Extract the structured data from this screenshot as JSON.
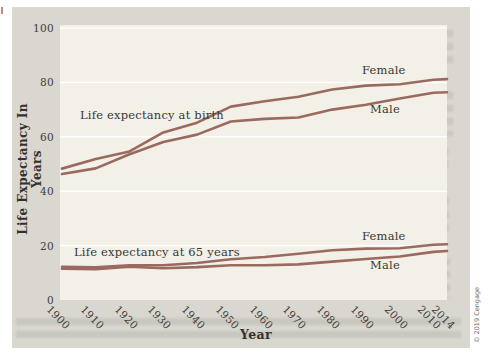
{
  "page": {
    "background": "#ffffff",
    "panel_bg": "#d9d7d0",
    "plot_bg": "#f2f0e7",
    "line_color": "#9a6a61",
    "grid_color": "rgba(255,255,255,0.88)",
    "text_color": "#3a3733",
    "copyright": "© 2019 Cengage"
  },
  "chart_data": {
    "type": "line",
    "title": "",
    "xlabel": "Year",
    "ylabel": "Life Expectancy In Years",
    "xlim": [
      1900,
      2014
    ],
    "ylim": [
      0,
      100
    ],
    "y_ticks": [
      0,
      20,
      40,
      60,
      80,
      100
    ],
    "x_ticks": [
      1900,
      1910,
      1920,
      1930,
      1940,
      1950,
      1960,
      1970,
      1980,
      1990,
      2000,
      2010,
      2014
    ],
    "grid": "horizontal white gridlines at each y tick",
    "legend_position": "inline labels next to lines",
    "x": [
      1900,
      1910,
      1920,
      1930,
      1940,
      1950,
      1960,
      1970,
      1980,
      1990,
      2000,
      2010,
      2014
    ],
    "annotations": [
      {
        "text": "Life expectancy at birth"
      },
      {
        "text": "Life expectancy at 65 years"
      }
    ],
    "series": [
      {
        "name": "female-at-birth",
        "label": "Female",
        "group": "at birth",
        "values": [
          48.3,
          51.8,
          54.6,
          61.6,
          65.2,
          71.1,
          73.1,
          74.7,
          77.4,
          78.8,
          79.3,
          81.0,
          81.2
        ]
      },
      {
        "name": "male-at-birth",
        "label": "Male",
        "group": "at birth",
        "values": [
          46.3,
          48.4,
          53.6,
          58.1,
          60.8,
          65.6,
          66.6,
          67.1,
          70.0,
          71.8,
          74.1,
          76.2,
          76.4
        ]
      },
      {
        "name": "female-at-65",
        "label": "Female",
        "group": "at 65 years",
        "values": [
          12.2,
          12.0,
          12.8,
          12.8,
          13.6,
          15.0,
          15.8,
          17.0,
          18.3,
          18.9,
          19.0,
          20.3,
          20.5
        ]
      },
      {
        "name": "male-at-65",
        "label": "Male",
        "group": "at 65 years",
        "values": [
          11.5,
          11.3,
          12.2,
          11.7,
          12.1,
          12.8,
          12.8,
          13.1,
          14.1,
          15.1,
          16.0,
          17.7,
          18.0
        ]
      }
    ]
  }
}
